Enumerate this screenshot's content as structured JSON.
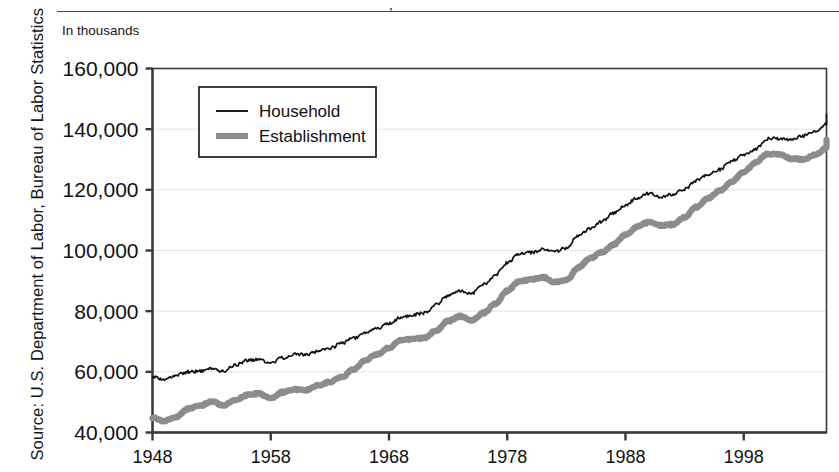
{
  "figure": {
    "units_label": "In thousands",
    "source_note": "Source: U.S. Department of Labor, Bureau of Labor Statistics",
    "title_descender": ","
  },
  "colors": {
    "household_line": "#111111",
    "establishment_line": "#8c8c8c",
    "axis": "#3a3a3a",
    "gridline": "#e2e2e2",
    "background": "#ffffff",
    "rule": "#4a4a4a"
  },
  "chart_data": {
    "type": "line",
    "title": "",
    "xlabel": "",
    "ylabel": "In thousands",
    "xlim": [
      1948,
      2005
    ],
    "ylim": [
      40000,
      160000
    ],
    "grid": true,
    "legend_position": "top-left-inside",
    "xticks": [
      1948,
      1958,
      1968,
      1978,
      1988,
      1998
    ],
    "xtick_labels": [
      "1948",
      "1958",
      "1968",
      "1978",
      "1988",
      "1998"
    ],
    "yticks": [
      40000,
      60000,
      80000,
      100000,
      120000,
      140000,
      160000
    ],
    "ytick_labels": [
      "40,000",
      "60,000",
      "80,000",
      "100,000",
      "120,000",
      "140,000",
      "160,000"
    ],
    "x": [
      1948,
      1949,
      1950,
      1951,
      1952,
      1953,
      1954,
      1955,
      1956,
      1957,
      1958,
      1959,
      1960,
      1961,
      1962,
      1963,
      1964,
      1965,
      1966,
      1967,
      1968,
      1969,
      1970,
      1971,
      1972,
      1973,
      1974,
      1975,
      1976,
      1977,
      1978,
      1979,
      1980,
      1981,
      1982,
      1983,
      1984,
      1985,
      1986,
      1987,
      1988,
      1989,
      1990,
      1991,
      1992,
      1993,
      1994,
      1995,
      1996,
      1997,
      1998,
      1999,
      2000,
      2001,
      2002,
      2003,
      2004,
      2005
    ],
    "series": [
      {
        "name": "Household",
        "style": "thin-black",
        "values": [
          58343,
          57651,
          58918,
          59961,
          60250,
          61179,
          60109,
          62170,
          63799,
          64071,
          63036,
          64630,
          65778,
          65746,
          66702,
          67762,
          69305,
          71088,
          72895,
          74372,
          75920,
          77902,
          78678,
          79367,
          82153,
          85064,
          86794,
          85846,
          88752,
          92017,
          96048,
          98824,
          99303,
          100397,
          99526,
          100834,
          105005,
          107150,
          109597,
          112440,
          114968,
          117342,
          118793,
          117718,
          118492,
          120259,
          123060,
          124900,
          126708,
          129558,
          131463,
          133488,
          136891,
          136933,
          136485,
          137736,
          139252,
          141730
        ],
        "endpoint_value": 145000
      },
      {
        "name": "Establishment",
        "style": "thick-gray",
        "values": [
          44866,
          43754,
          45197,
          47819,
          48793,
          50202,
          48990,
          50641,
          52369,
          52853,
          51324,
          53268,
          54189,
          53999,
          55549,
          56653,
          58283,
          60765,
          63901,
          65803,
          67897,
          70384,
          70880,
          71214,
          73675,
          76790,
          78265,
          76945,
          79382,
          82471,
          86697,
          89823,
          90406,
          91152,
          89544,
          90152,
          94408,
          97387,
          99344,
          101958,
          105210,
          107895,
          109419,
          108256,
          108604,
          110995,
          114291,
          117298,
          119708,
          122776,
          125930,
          128993,
          131785,
          131826,
          130341,
          129999,
          131435,
          133703
        ],
        "endpoint_value": 136500
      }
    ]
  },
  "legend": {
    "items": [
      {
        "label": "Household",
        "marker": "thin-black-line"
      },
      {
        "label": "Establishment",
        "marker": "thick-gray-line"
      }
    ]
  }
}
